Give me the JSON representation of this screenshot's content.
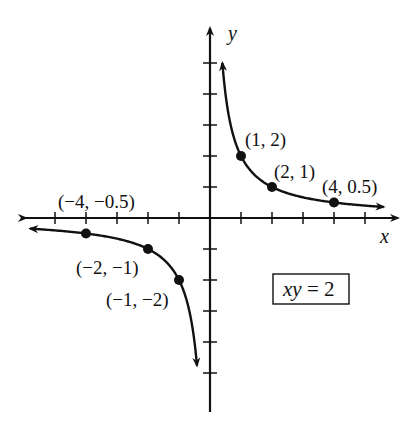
{
  "chart_data": {
    "type": "line",
    "title": "",
    "equation": "xy = 2",
    "function": "y = 2/x",
    "xlabel": "x",
    "ylabel": "y",
    "xlim": [
      -6,
      6
    ],
    "ylim": [
      -5,
      5
    ],
    "tick_step": 1,
    "grid": false,
    "legend": null,
    "labeled_points": [
      {
        "x": 1,
        "y": 2,
        "label": "(1, 2)"
      },
      {
        "x": 2,
        "y": 1,
        "label": "(2, 1)"
      },
      {
        "x": 4,
        "y": 0.5,
        "label": "(4, 0.5)"
      },
      {
        "x": -4,
        "y": -0.5,
        "label": "(−4, −0.5)"
      },
      {
        "x": -2,
        "y": -1,
        "label": "(−2, −1)"
      },
      {
        "x": -1,
        "y": -2,
        "label": "(−1, −2)"
      }
    ],
    "series": [
      {
        "name": "branch-quadrant-I",
        "x_range": [
          0.4,
          5.6
        ]
      },
      {
        "name": "branch-quadrant-III",
        "x_range": [
          -5.8,
          -0.42
        ]
      }
    ]
  },
  "labels": {
    "x_axis": "x",
    "y_axis": "y",
    "equation_var": "xy",
    "equation_rest": " = 2",
    "p1": "(1, 2)",
    "p2": "(2, 1)",
    "p3": "(4, 0.5)",
    "p4": "(−4, −0.5)",
    "p5": "(−2, −1)",
    "p6": "(−1, −2)"
  }
}
